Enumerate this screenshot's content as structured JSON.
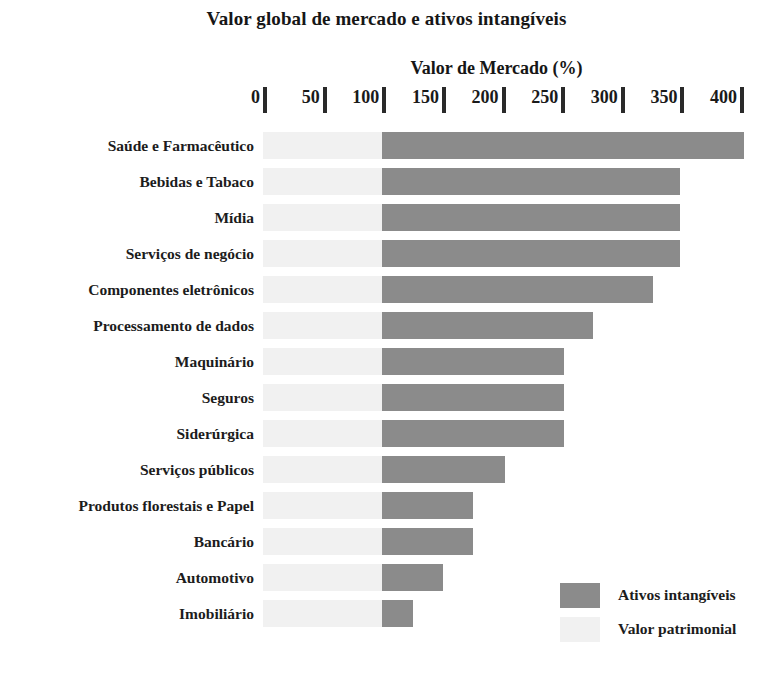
{
  "chart_data": {
    "type": "bar",
    "orientation": "horizontal",
    "stacked": true,
    "title": "Valor global de mercado e ativos intangíveis",
    "xlabel": "Valor de Mercado (%)",
    "ylabel": "",
    "xlim": [
      0,
      420
    ],
    "xticks": [
      0,
      50,
      100,
      150,
      200,
      250,
      300,
      350,
      400
    ],
    "xticklabels": [
      "0",
      "50",
      "100",
      "150",
      "200",
      "250",
      "300",
      "350",
      "400"
    ],
    "grid": false,
    "legend_position": "bottom-right",
    "categories": [
      "Saúde e Farmacêutico",
      "Bebidas e Tabaco",
      "Mídia",
      "Serviços de negócio",
      "Componentes eletrônicos",
      "Processamento de dados",
      "Maquinário",
      "Seguros",
      "Siderúrgica",
      "Serviços públicos",
      "Produtos florestais e Papel",
      "Bancário",
      "Automotivo",
      "Imobiliário"
    ],
    "series": [
      {
        "name": "Valor patrimonial",
        "color": "#f1f1f1",
        "values": [
          100,
          100,
          100,
          100,
          100,
          100,
          100,
          100,
          100,
          100,
          100,
          100,
          100,
          100
        ]
      },
      {
        "name": "Ativos intangíveis",
        "color": "#8b8b8b",
        "values": [
          303,
          250,
          250,
          250,
          227,
          177,
          152,
          152,
          152,
          103,
          76,
          76,
          51,
          26
        ]
      }
    ],
    "totals": [
      403,
      350,
      350,
      350,
      327,
      277,
      252,
      252,
      252,
      203,
      176,
      176,
      151,
      126
    ]
  },
  "legend": {
    "items": [
      {
        "label": "Ativos intangíveis",
        "color": "#8b8b8b"
      },
      {
        "label": "Valor patrimonial",
        "color": "#f1f1f1"
      }
    ]
  }
}
